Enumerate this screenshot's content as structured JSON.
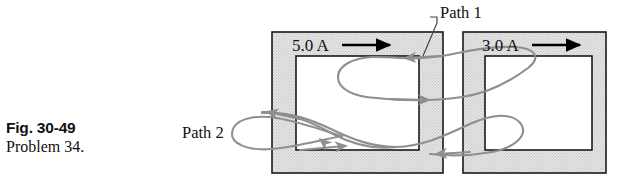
{
  "figure": {
    "caption": {
      "figure_number": "Fig. 30-49",
      "problem": "Problem 34."
    },
    "labels": {
      "current_left": "5.0 A",
      "current_right": "3.0 A",
      "path1": "Path 1",
      "path2": "Path 2"
    },
    "colors": {
      "conductor_fill": "#dcdcdc",
      "conductor_stroke": "#1a1a1a",
      "hole_fill": "#ffffff",
      "path_curve": "#8f8f8f",
      "arrow_black": "#000000",
      "text": "#111111",
      "background": "#ffffff"
    },
    "elements": {
      "left_conductor_name": "left-square-conductor",
      "right_conductor_name": "right-square-conductor",
      "current_arrow_left_name": "current-direction-arrow-left",
      "current_arrow_right_name": "current-direction-arrow-right",
      "path1_name": "amperian-path-1-curve",
      "path2_name": "amperian-path-2-curve",
      "leader_name": "path-1-leader-line"
    }
  }
}
